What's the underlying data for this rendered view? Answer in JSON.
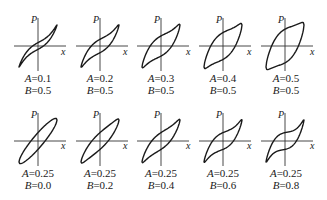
{
  "figure": {
    "axis_labels": {
      "vertical": "P",
      "horizontal": "x"
    },
    "rows": [
      {
        "panels": [
          {
            "A": "0.1",
            "B": "0.5",
            "a_text": "=0.1",
            "b_text": "=0.5"
          },
          {
            "A": "0.2",
            "B": "0.5",
            "a_text": "=0.2",
            "b_text": "=0.5"
          },
          {
            "A": "0.3",
            "B": "0.5",
            "a_text": "=0.3",
            "b_text": "=0.5"
          },
          {
            "A": "0.4",
            "B": "0.5",
            "a_text": "=0.4",
            "b_text": "=0.5"
          },
          {
            "A": "0.5",
            "B": "0.5",
            "a_text": "=0.5",
            "b_text": "=0.5"
          }
        ]
      },
      {
        "panels": [
          {
            "A": "0.25",
            "B": "0.0",
            "a_text": "=0.25",
            "b_text": "=0.0"
          },
          {
            "A": "0.25",
            "B": "0.2",
            "a_text": "=0.25",
            "b_text": "=0.2"
          },
          {
            "A": "0.25",
            "B": "0.4",
            "a_text": "=0.25",
            "b_text": "=0.4"
          },
          {
            "A": "0.25",
            "B": "0.6",
            "a_text": "=0.25",
            "b_text": "=0.6"
          },
          {
            "A": "0.25",
            "B": "0.8",
            "a_text": "=0.25",
            "b_text": "=0.8"
          }
        ]
      }
    ],
    "param_names": {
      "a": "A",
      "b": "B"
    },
    "colors": {
      "line": "#1a1a1a",
      "axis": "#333333",
      "background": "#ffffff"
    }
  }
}
